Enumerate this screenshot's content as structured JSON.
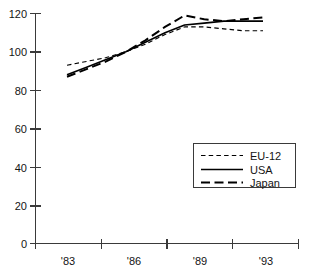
{
  "chart_data": {
    "type": "line",
    "title": "",
    "subtitle": "",
    "xlabel": "",
    "ylabel": "",
    "x": [
      "'83",
      "'84",
      "'85",
      "'86",
      "'87",
      "'88",
      "'89",
      "'90",
      "'91",
      "'92",
      "'93"
    ],
    "xtick_labels": [
      "'83",
      "'86",
      "'89",
      "'93"
    ],
    "ytick_labels": [
      "0",
      "20",
      "40",
      "60",
      "80",
      "100",
      "120"
    ],
    "ytick_values": [
      0,
      20,
      40,
      60,
      80,
      100,
      120
    ],
    "ylim": [
      0,
      124
    ],
    "xlim": [
      1983,
      1993
    ],
    "grid": false,
    "legend_position": "bottom-right",
    "series": [
      {
        "name": "EU-12",
        "style": "short-dash",
        "color": "#000000",
        "x": [
          1983,
          1984,
          1985,
          1986,
          1987,
          1988,
          1989,
          1990,
          1991,
          1992,
          1993
        ],
        "values": [
          93,
          95,
          97,
          100,
          104,
          109,
          113,
          113,
          112,
          111,
          111
        ]
      },
      {
        "name": "USA",
        "style": "solid",
        "color": "#000000",
        "x": [
          1983,
          1984,
          1985,
          1986,
          1987,
          1988,
          1989,
          1990,
          1991,
          1992,
          1993
        ],
        "values": [
          88,
          92,
          96,
          100,
          105,
          110,
          114,
          115,
          116,
          116,
          116
        ]
      },
      {
        "name": "Japan",
        "style": "long-dash",
        "color": "#000000",
        "x": [
          1983,
          1984,
          1985,
          1986,
          1987,
          1988,
          1989,
          1990,
          1991,
          1992,
          1993
        ],
        "values": [
          87,
          91,
          95,
          100,
          106,
          113,
          119,
          117,
          116,
          117,
          118
        ]
      }
    ]
  },
  "legend": {
    "items": [
      {
        "label": "EU-12"
      },
      {
        "label": "USA"
      },
      {
        "label": "Japan"
      }
    ]
  },
  "axes": {
    "y_labels": [
      "120",
      "100",
      "80",
      "60",
      "40",
      "20",
      "0"
    ],
    "x_labels": [
      "'83",
      "'86",
      "'89",
      "'93"
    ]
  }
}
